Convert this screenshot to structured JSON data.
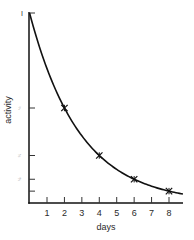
{
  "chart_data": {
    "type": "line",
    "title": "",
    "xlabel": "days",
    "ylabel": "activity",
    "x_ticks": [
      1,
      2,
      3,
      4,
      5,
      6,
      7,
      8
    ],
    "x_tick_labels": [
      "1",
      "2",
      "3",
      "4",
      "5",
      "6",
      "7",
      "8"
    ],
    "xlim": [
      0,
      8.8
    ],
    "ylim": [
      0,
      1
    ],
    "y_ticks": [
      1,
      0.5,
      0.25,
      0.125,
      0.0625
    ],
    "y_tick_labels": [
      "I",
      "½",
      "¼",
      "⅛",
      ""
    ],
    "grid": false,
    "legend": null,
    "series": [
      {
        "name": "decay curve",
        "style": "smooth-line",
        "half_life_days": 2,
        "x": [
          0,
          1,
          2,
          3,
          4,
          5,
          6,
          7,
          8,
          8.8
        ],
        "values": [
          1,
          0.707,
          0.5,
          0.354,
          0.25,
          0.177,
          0.125,
          0.088,
          0.0625,
          0.047
        ]
      },
      {
        "name": "measured points",
        "style": "star-markers",
        "x": [
          2,
          4,
          6,
          8
        ],
        "values": [
          0.5,
          0.25,
          0.125,
          0.0625
        ]
      }
    ]
  },
  "axes": {
    "x_label": "days",
    "y_label": "activity",
    "y_top_label": "I"
  }
}
